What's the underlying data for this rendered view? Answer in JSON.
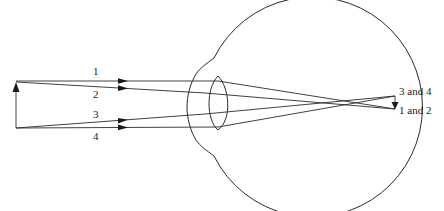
{
  "diagram": {
    "type": "optics-eye-ray-diagram",
    "object": {
      "name": "object-arrow",
      "x": 16,
      "tip_y": 84,
      "base_y": 128
    },
    "rays": [
      {
        "id": "1",
        "label": "1",
        "label_pos": [
          96,
          75
        ],
        "arrow_at": [
          125,
          80
        ]
      },
      {
        "id": "2",
        "label": "2",
        "label_pos": [
          96,
          98
        ],
        "arrow_at": [
          125,
          88
        ]
      },
      {
        "id": "3",
        "label": "3",
        "label_pos": [
          96,
          117
        ],
        "arrow_at": [
          125,
          119
        ]
      },
      {
        "id": "4",
        "label": "4",
        "label_pos": [
          96,
          140
        ],
        "arrow_at": [
          125,
          127
        ]
      }
    ],
    "image_labels": {
      "top": "3 and 4",
      "bottom": "1 and 2"
    },
    "colors": {
      "line": "#2a2a2a",
      "background": "#ffffff"
    }
  }
}
